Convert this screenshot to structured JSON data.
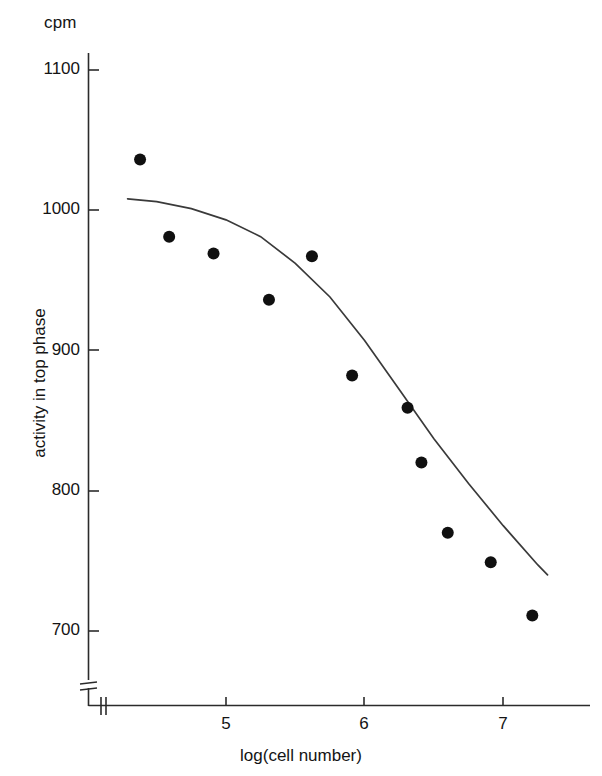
{
  "chart_data": {
    "type": "scatter",
    "title": "",
    "xlabel": "log(cell number)",
    "ylabel": "activity in top phase",
    "yunit": "cpm",
    "xlim": [
      4.2,
      7.35
    ],
    "ylim": [
      690,
      1115
    ],
    "xticks": [
      5,
      6,
      7
    ],
    "xticklabels": [
      "5",
      "6",
      "7"
    ],
    "yticks": [
      700,
      800,
      900,
      1000,
      1100
    ],
    "yticklabels": [
      "700",
      "800",
      "900",
      "1000",
      "1100"
    ],
    "grid": false,
    "legend": null,
    "axis_break": {
      "axis": "y",
      "note": "break mark near origin"
    },
    "x": [
      4.38,
      4.59,
      4.91,
      5.31,
      5.62,
      5.91,
      6.31,
      6.41,
      6.6,
      6.91,
      7.21
    ],
    "values": [
      1036,
      981,
      969,
      936,
      967,
      882,
      859,
      820,
      770,
      749,
      711
    ],
    "points": [
      {
        "x": 4.38,
        "y": 1036
      },
      {
        "x": 4.59,
        "y": 981
      },
      {
        "x": 4.91,
        "y": 969
      },
      {
        "x": 5.31,
        "y": 936
      },
      {
        "x": 5.62,
        "y": 967
      },
      {
        "x": 5.91,
        "y": 882
      },
      {
        "x": 6.31,
        "y": 859
      },
      {
        "x": 6.41,
        "y": 820
      },
      {
        "x": 6.6,
        "y": 770
      },
      {
        "x": 6.91,
        "y": 749
      },
      {
        "x": 7.21,
        "y": 711
      }
    ],
    "fit_curve": {
      "name": "sigmoid fit",
      "x": [
        4.29,
        4.5,
        4.75,
        5.0,
        5.25,
        5.5,
        5.75,
        6.0,
        6.25,
        6.5,
        6.75,
        7.0,
        7.25,
        7.32
      ],
      "y": [
        1008,
        1006,
        1001,
        993,
        981,
        962,
        938,
        907,
        872,
        837,
        805,
        775,
        747,
        740
      ]
    },
    "marker": {
      "shape": "circle",
      "color": "#101010",
      "size": 12
    },
    "line_color": "#3a3a3a",
    "axis_color": "#2b2b2b"
  }
}
